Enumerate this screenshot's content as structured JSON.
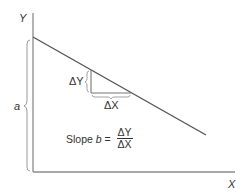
{
  "diagram": {
    "axes": {
      "y_label": "Y",
      "x_label": "X"
    },
    "intercept_label": "a",
    "delta_y_label": "ΔY",
    "delta_x_label": "ΔX",
    "slope_formula": {
      "prefix": "Slope ",
      "variable": "b",
      "equals": " = ",
      "numerator": "ΔY",
      "denominator": "ΔX"
    },
    "colors": {
      "line": "#555555",
      "axis": "#888888",
      "text": "#333333"
    }
  }
}
